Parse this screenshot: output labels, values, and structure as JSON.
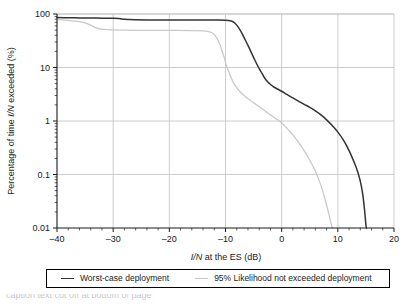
{
  "chart_data": {
    "type": "line",
    "title": "",
    "xlabel": "I/N at the ES (dB)",
    "ylabel": "Percentage of time I/N exceeded (%)",
    "xlim": [
      -40,
      20
    ],
    "ylim": [
      0.01,
      100
    ],
    "yscale": "log",
    "grid": true,
    "legend_position": "below",
    "xticks": [
      "–40",
      "–30",
      "–20",
      "–10",
      "0",
      "10",
      "20"
    ],
    "xtick_values": [
      -40,
      -30,
      -20,
      -10,
      0,
      10,
      20
    ],
    "yticks": [
      "100",
      "10",
      "1",
      "0.1",
      "0.01"
    ],
    "ytick_values": [
      100,
      10,
      1,
      0.1,
      0.01
    ],
    "series": [
      {
        "name": "Worst-case deployment",
        "color": "#333333",
        "x": [
          -40,
          -38,
          -36,
          -34,
          -32,
          -30,
          -29,
          -28,
          -27,
          -26,
          -24,
          -20,
          -16,
          -12,
          -10,
          -9,
          -8.5,
          -8,
          -7.5,
          -7,
          -6.5,
          -6,
          -5.5,
          -5,
          -4.5,
          -4,
          -3.5,
          -3,
          -2.5,
          -2,
          -1.5,
          -1,
          0,
          1,
          2,
          3,
          4,
          5,
          6,
          7,
          8,
          9,
          10,
          11,
          12,
          13,
          13.5,
          14,
          14.4,
          14.7,
          15,
          15.1
        ],
        "y": [
          86,
          85,
          84.5,
          84,
          83.5,
          83,
          82,
          80,
          78.5,
          78,
          77.5,
          77,
          77,
          77,
          76.5,
          74,
          70,
          62,
          52,
          42,
          33,
          26,
          20,
          15.5,
          12,
          9.5,
          7.8,
          6.3,
          5.4,
          4.8,
          4.4,
          4.1,
          3.6,
          3.1,
          2.7,
          2.35,
          2.05,
          1.8,
          1.55,
          1.3,
          1.05,
          0.82,
          0.62,
          0.44,
          0.28,
          0.16,
          0.115,
          0.075,
          0.045,
          0.025,
          0.0115,
          0.01
        ]
      },
      {
        "name": "95% Likelihood not exceeded deployment",
        "color": "#c9c9c9",
        "x": [
          -40,
          -38,
          -36,
          -35,
          -34,
          -33.5,
          -33,
          -32.5,
          -32,
          -31,
          -30,
          -28,
          -24,
          -20,
          -16,
          -14,
          -13,
          -12.5,
          -12,
          -11.5,
          -11,
          -10.8,
          -10.5,
          -10.2,
          -10,
          -9.7,
          -9.4,
          -9,
          -8.5,
          -8,
          -7.5,
          -7,
          -6,
          -5,
          -4,
          -3,
          -2,
          -1,
          0,
          0.5,
          1,
          2,
          3,
          4,
          5,
          6,
          7,
          7.8,
          8.3,
          8.7,
          8.9,
          9
        ],
        "y": [
          79,
          76,
          72,
          68,
          62,
          58,
          55,
          53,
          52,
          51,
          50.5,
          50,
          49.5,
          49.5,
          49,
          48.5,
          47,
          45,
          41,
          35,
          27,
          23,
          19,
          15,
          12.5,
          10,
          8.2,
          6.5,
          5.0,
          4.2,
          3.6,
          3.2,
          2.6,
          2.2,
          1.85,
          1.55,
          1.3,
          1.1,
          0.92,
          0.82,
          0.72,
          0.55,
          0.4,
          0.28,
          0.185,
          0.115,
          0.062,
          0.032,
          0.02,
          0.0135,
          0.0112,
          0.01
        ]
      }
    ]
  },
  "legend": {
    "entries": [
      {
        "label": "Worst-case deployment",
        "color": "#333333"
      },
      {
        "label": "95% Likelihood not exceeded deployment",
        "color": "#c9c9c9"
      }
    ]
  },
  "caption": {
    "partial_text": "caption text cut off at bottom of page"
  }
}
